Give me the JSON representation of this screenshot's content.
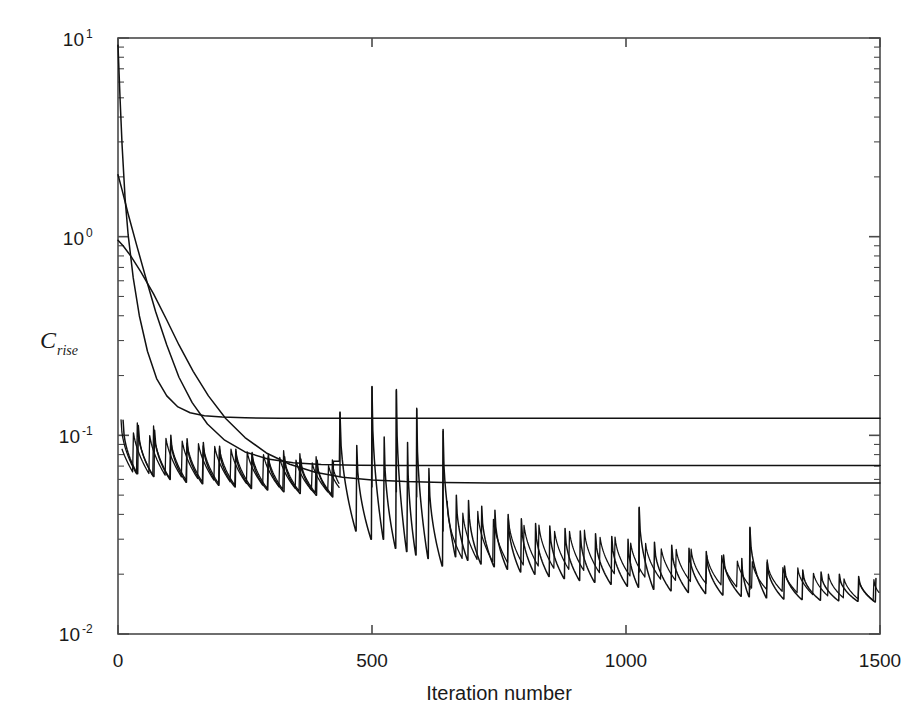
{
  "figure": {
    "width": 917,
    "height": 717,
    "background": "#ffffff",
    "line_color": "#111111",
    "axis_color": "#4a4a4a"
  },
  "axes": {
    "left": 118,
    "right": 880,
    "top": 38,
    "bottom": 634
  },
  "labels": {
    "xlabel": "Iteration number",
    "ylabel_base": "C",
    "ylabel_sub": "rise",
    "ylabel_full": "C_rise",
    "xticks": [
      "0",
      "500",
      "1000",
      "1500"
    ],
    "yticks": [
      "10",
      "10",
      "10",
      "10"
    ],
    "yexp": [
      "1",
      "0",
      "-1",
      "-2"
    ]
  },
  "chart_data": {
    "type": "line",
    "title": "",
    "xlabel": "Iteration number",
    "ylabel": "C_rise",
    "xlim": [
      0,
      1500
    ],
    "ylim": [
      0.01,
      10
    ],
    "yscale": "log",
    "xscale": "linear",
    "grid": false,
    "legend": null,
    "xticks": [
      0,
      500,
      1000,
      1500
    ],
    "yticks": [
      0.01,
      0.1,
      1,
      10
    ],
    "ytick_labels": [
      "10^-2",
      "10^-1",
      "10^0",
      "10^1"
    ],
    "minor_ticks": true,
    "series": [
      {
        "name": "converged-plateau-high",
        "description": "Monotone decaying curve that flattens to a constant plateau",
        "style": "solid",
        "plateau_value": 0.122,
        "points": [
          [
            0,
            9.2
          ],
          [
            4,
            5.0
          ],
          [
            8,
            2.9
          ],
          [
            14,
            1.55
          ],
          [
            20,
            1.02
          ],
          [
            30,
            0.62
          ],
          [
            42,
            0.4
          ],
          [
            58,
            0.265
          ],
          [
            76,
            0.193
          ],
          [
            96,
            0.158
          ],
          [
            118,
            0.139
          ],
          [
            142,
            0.13
          ],
          [
            170,
            0.1255
          ],
          [
            205,
            0.1235
          ],
          [
            250,
            0.1225
          ],
          [
            320,
            0.122
          ],
          [
            420,
            0.122
          ],
          [
            600,
            0.122
          ],
          [
            900,
            0.122
          ],
          [
            1200,
            0.122
          ],
          [
            1500,
            0.122
          ]
        ]
      },
      {
        "name": "converged-plateau-mid",
        "description": "Decaying curve flattening to a mid plateau",
        "style": "solid",
        "plateau_value": 0.0705,
        "points": [
          [
            0,
            2.05
          ],
          [
            8,
            1.72
          ],
          [
            20,
            1.3
          ],
          [
            36,
            0.92
          ],
          [
            54,
            0.63
          ],
          [
            74,
            0.42
          ],
          [
            96,
            0.285
          ],
          [
            120,
            0.196
          ],
          [
            146,
            0.146
          ],
          [
            176,
            0.114
          ],
          [
            210,
            0.0945
          ],
          [
            250,
            0.0825
          ],
          [
            295,
            0.076
          ],
          [
            345,
            0.0727
          ],
          [
            400,
            0.0713
          ],
          [
            470,
            0.0707
          ],
          [
            560,
            0.0705
          ],
          [
            700,
            0.0705
          ],
          [
            900,
            0.0705
          ],
          [
            1200,
            0.0705
          ],
          [
            1500,
            0.0705
          ]
        ]
      },
      {
        "name": "converged-plateau-low",
        "description": "Decaying curve flattening to the lowest plateau",
        "style": "solid",
        "plateau_value": 0.0575,
        "points": [
          [
            0,
            0.96
          ],
          [
            10,
            0.9
          ],
          [
            25,
            0.8
          ],
          [
            45,
            0.665
          ],
          [
            70,
            0.515
          ],
          [
            95,
            0.385
          ],
          [
            120,
            0.285
          ],
          [
            148,
            0.21
          ],
          [
            178,
            0.158
          ],
          [
            212,
            0.1215
          ],
          [
            250,
            0.0975
          ],
          [
            292,
            0.0815
          ],
          [
            338,
            0.0715
          ],
          [
            388,
            0.0652
          ],
          [
            442,
            0.0615
          ],
          [
            500,
            0.0596
          ],
          [
            566,
            0.0585
          ],
          [
            640,
            0.0579
          ],
          [
            730,
            0.0576
          ],
          [
            860,
            0.0575
          ],
          [
            1050,
            0.0575
          ],
          [
            1500,
            0.0575
          ]
        ]
      },
      {
        "name": "oscillating-sawtooth",
        "description": "Sawtooth / cyclic-restart curve: rapid spikes followed by decay, overall envelope decreasing from ~0.12 to ~0.015",
        "style": "solid",
        "envelope_peak_start": 0.125,
        "envelope_peak_end": 0.0175,
        "envelope_trough_start": 0.062,
        "envelope_trough_end": 0.0145,
        "cycle_peaks": [
          [
            10,
            0.119
          ],
          [
            40,
            0.112
          ],
          [
            72,
            0.106
          ],
          [
            104,
            0.1
          ],
          [
            136,
            0.096
          ],
          [
            168,
            0.092
          ],
          [
            200,
            0.088
          ],
          [
            232,
            0.085
          ],
          [
            264,
            0.082
          ],
          [
            296,
            0.08
          ],
          [
            328,
            0.078
          ],
          [
            360,
            0.076
          ],
          [
            392,
            0.075
          ],
          [
            424,
            0.074
          ],
          [
            437,
            0.13
          ],
          [
            470,
            0.089
          ],
          [
            500,
            0.175
          ],
          [
            524,
            0.098
          ],
          [
            548,
            0.168
          ],
          [
            570,
            0.092
          ],
          [
            588,
            0.135
          ],
          [
            612,
            0.068
          ],
          [
            640,
            0.105
          ],
          [
            666,
            0.05
          ],
          [
            690,
            0.047
          ],
          [
            716,
            0.044
          ],
          [
            742,
            0.042
          ],
          [
            768,
            0.04
          ],
          [
            794,
            0.038
          ],
          [
            822,
            0.036
          ],
          [
            850,
            0.035
          ],
          [
            880,
            0.034
          ],
          [
            910,
            0.033
          ],
          [
            940,
            0.032
          ],
          [
            972,
            0.031
          ],
          [
            1004,
            0.03
          ],
          [
            1026,
            0.043
          ],
          [
            1056,
            0.029
          ],
          [
            1090,
            0.028
          ],
          [
            1124,
            0.027
          ],
          [
            1158,
            0.026
          ],
          [
            1192,
            0.025
          ],
          [
            1228,
            0.024
          ],
          [
            1244,
            0.034
          ],
          [
            1278,
            0.023
          ],
          [
            1312,
            0.022
          ],
          [
            1348,
            0.021
          ],
          [
            1384,
            0.0205
          ],
          [
            1420,
            0.02
          ],
          [
            1458,
            0.0195
          ],
          [
            1492,
            0.019
          ]
        ],
        "cycle_troughs": [
          [
            38,
            0.064
          ],
          [
            70,
            0.062
          ],
          [
            102,
            0.06
          ],
          [
            134,
            0.058
          ],
          [
            166,
            0.057
          ],
          [
            198,
            0.056
          ],
          [
            230,
            0.055
          ],
          [
            262,
            0.054
          ],
          [
            294,
            0.053
          ],
          [
            326,
            0.052
          ],
          [
            358,
            0.051
          ],
          [
            390,
            0.05
          ],
          [
            422,
            0.049
          ],
          [
            468,
            0.033
          ],
          [
            498,
            0.03
          ],
          [
            522,
            0.03
          ],
          [
            546,
            0.027
          ],
          [
            568,
            0.026
          ],
          [
            586,
            0.025
          ],
          [
            610,
            0.024
          ],
          [
            638,
            0.022
          ],
          [
            664,
            0.0245
          ],
          [
            688,
            0.0235
          ],
          [
            714,
            0.0225
          ],
          [
            740,
            0.0218
          ],
          [
            766,
            0.0212
          ],
          [
            792,
            0.0205
          ],
          [
            820,
            0.02
          ],
          [
            848,
            0.0195
          ],
          [
            878,
            0.019
          ],
          [
            908,
            0.0186
          ],
          [
            938,
            0.0182
          ],
          [
            970,
            0.0178
          ],
          [
            1002,
            0.0174
          ],
          [
            1024,
            0.0172
          ],
          [
            1054,
            0.0168
          ],
          [
            1088,
            0.0165
          ],
          [
            1122,
            0.0162
          ],
          [
            1156,
            0.016
          ],
          [
            1190,
            0.0157
          ],
          [
            1226,
            0.0155
          ],
          [
            1242,
            0.0154
          ],
          [
            1276,
            0.0152
          ],
          [
            1310,
            0.015
          ],
          [
            1346,
            0.0149
          ],
          [
            1382,
            0.0148
          ],
          [
            1418,
            0.0147
          ],
          [
            1456,
            0.0146
          ],
          [
            1490,
            0.0145
          ]
        ]
      }
    ]
  }
}
